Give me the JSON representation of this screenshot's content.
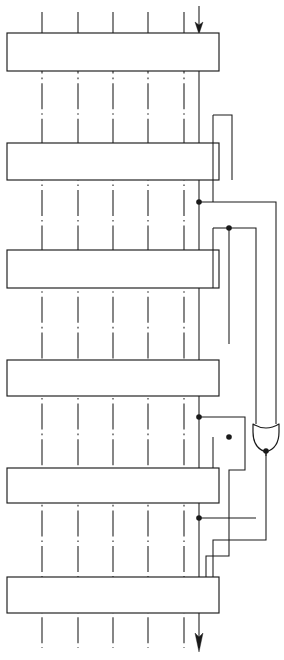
{
  "figure": {
    "type": "logic-schematic",
    "canvas": {
      "width": 284,
      "height": 660
    },
    "background_color": "#ffffff",
    "line_color": "#1a1a1a"
  },
  "registers": [
    {
      "name": "register-stage-1",
      "x": 7,
      "y": 33,
      "width": 212,
      "height": 38
    },
    {
      "name": "register-stage-2",
      "x": 7,
      "y": 143,
      "width": 212,
      "height": 37
    },
    {
      "name": "register-stage-3",
      "x": 7,
      "y": 250,
      "width": 212,
      "height": 38
    },
    {
      "name": "register-stage-4",
      "x": 7,
      "y": 360,
      "width": 212,
      "height": 36
    },
    {
      "name": "register-stage-5",
      "x": 7,
      "y": 468,
      "width": 212,
      "height": 35
    },
    {
      "name": "register-stage-6",
      "x": 7,
      "y": 577,
      "width": 212,
      "height": 36
    }
  ],
  "bitlines": {
    "label": "dash-dot bit column lines",
    "x_positions": [
      42,
      78,
      113,
      148,
      184
    ],
    "y_top": 12,
    "y_bottom": 648
  },
  "input": {
    "name": "serial-data-input",
    "x": 199,
    "y_start": 6,
    "y_arrow_tip": 33
  },
  "output": {
    "name": "serial-data-output",
    "x": 199,
    "y_start": 613,
    "y_arrow_tip": 652
  },
  "feedback_bus": {
    "x": 199,
    "y_top": 33,
    "y_bottom": 613,
    "description": "main stage-to-stage cascade line running down the right side of every register"
  },
  "taps": [
    {
      "name": "tap-junction-a",
      "x": 199,
      "y": 202
    },
    {
      "name": "tap-junction-b",
      "x": 229,
      "y": 228
    },
    {
      "name": "tap-junction-c",
      "x": 199,
      "y": 417
    },
    {
      "name": "tap-junction-d",
      "x": 229,
      "y": 437
    },
    {
      "name": "tap-junction-e",
      "x": 199,
      "y": 518
    },
    {
      "name": "tap-junction-f",
      "x": 266,
      "y": 451
    }
  ],
  "gate": {
    "name": "or-gate-feedback",
    "kind": "or",
    "orientation": "down",
    "cx": 266,
    "top_y": 424,
    "bottom_y": 452,
    "half_width": 13,
    "inputs": [
      "tap-junction-a-branch",
      "tap-junction-b-branch"
    ],
    "output": "feedback-return-line"
  },
  "routing_lines": [
    {
      "name": "feedback-route-1",
      "points": "199,202 276,202 276,424"
    },
    {
      "name": "feedback-route-2",
      "points": "229,228 256,228 256,424"
    },
    {
      "name": "feedback-route-3",
      "points": "213,115 213,202"
    },
    {
      "name": "feedback-route-4",
      "points": "229,228 229,344"
    },
    {
      "name": "feedback-route-5",
      "points": "266,452 266,540 213,540 213,577"
    },
    {
      "name": "feedback-route-6",
      "points": "199,417 245,417 245,470 229,470 229,518"
    },
    {
      "name": "feedback-route-7",
      "points": "199,518 256,518"
    }
  ],
  "counts": {
    "register_stages": 6,
    "bit_columns": 5,
    "junction_dots": 6,
    "logic_gates": 1
  }
}
